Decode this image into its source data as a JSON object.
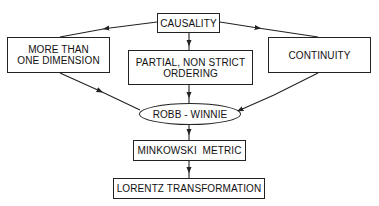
{
  "diagram": {
    "nodes": {
      "causality": {
        "label": "CAUSALITY"
      },
      "more_dims": {
        "label": "MORE THAN\nONE DIMENSION"
      },
      "partial": {
        "label": "PARTIAL, NON STRICT\nORDERING"
      },
      "continuity": {
        "label": "CONTINUITY"
      },
      "robb": {
        "label": "ROBB - WINNIE"
      },
      "minkowski": {
        "label": "MINKOWSKI  METRIC"
      },
      "lorentz": {
        "label": "LORENTZ TRANSFORMATION"
      }
    },
    "edges": [
      {
        "from": "CAUSALITY",
        "to": "MORE THAN ONE DIMENSION"
      },
      {
        "from": "CAUSALITY",
        "to": "PARTIAL, NON STRICT ORDERING"
      },
      {
        "from": "CAUSALITY",
        "to": "CONTINUITY"
      },
      {
        "from": "MORE THAN ONE DIMENSION",
        "to": "ROBB - WINNIE"
      },
      {
        "from": "PARTIAL, NON STRICT ORDERING",
        "to": "ROBB - WINNIE"
      },
      {
        "from": "CONTINUITY",
        "to": "ROBB - WINNIE"
      },
      {
        "from": "ROBB - WINNIE",
        "to": "MINKOWSKI METRIC"
      },
      {
        "from": "MINKOWSKI METRIC",
        "to": "LORENTZ TRANSFORMATION"
      }
    ],
    "colors": {
      "line": "#222222",
      "background": "#ffffff"
    }
  }
}
